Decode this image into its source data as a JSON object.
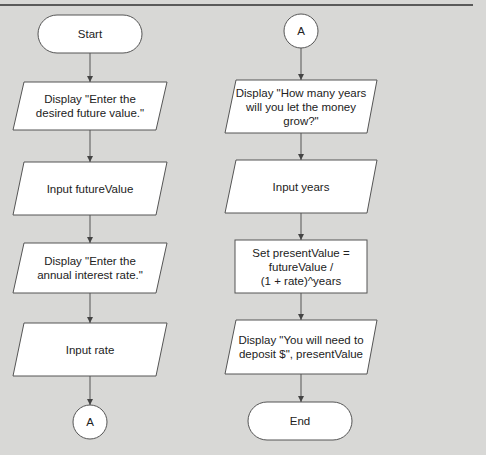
{
  "flowchart": {
    "left_column": {
      "start": "Start",
      "display_future": "Display \"Enter the\ndesired future value.\"",
      "input_future": "Input futureValue",
      "display_rate": "Display \"Enter the\nannual interest rate.\"",
      "input_rate": "Input rate",
      "connector_out": "A"
    },
    "right_column": {
      "connector_in": "A",
      "display_years": "Display \"How many years\nwill you let the money\ngrow?\"",
      "input_years": "Input years",
      "process": "Set presentValue =\nfutureValue /\n(1 + rate)^years",
      "display_result": "Display \"You will need to\ndeposit $\", presentValue",
      "end": "End"
    }
  },
  "colors": {
    "background": "#d8d8d6",
    "shape_fill": "#ffffff",
    "stroke": "#444444"
  }
}
